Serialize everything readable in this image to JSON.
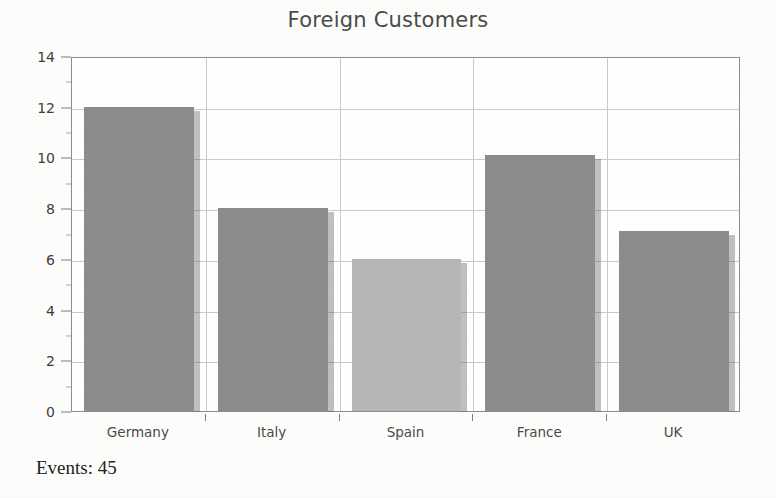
{
  "chart_data": {
    "type": "bar",
    "title": "Foreign Customers",
    "xlabel": "",
    "ylabel": "",
    "categories": [
      "Germany",
      "Italy",
      "Spain",
      "France",
      "UK"
    ],
    "values": [
      12.0,
      8.0,
      6.0,
      10.1,
      7.1
    ],
    "series": [
      {
        "name": "Foreign Customers",
        "values": [
          12.0,
          8.0,
          6.0,
          10.1,
          7.1
        ]
      }
    ],
    "ylim": [
      0,
      14
    ],
    "y_ticks": [
      0,
      2,
      4,
      6,
      8,
      10,
      12,
      14
    ],
    "y_tick_labels": [
      "0",
      "2",
      "4",
      "6",
      "8",
      "10",
      "12",
      "14"
    ],
    "grid": "both",
    "legend": "none",
    "bar_colors": [
      "#8c8c8c",
      "#8c8c8c",
      "#b6b6b6",
      "#8c8c8c",
      "#8c8c8c"
    ],
    "highlighted_category": "Spain",
    "annotations": [
      {
        "name": "events-count",
        "text": "Events: 45"
      }
    ]
  },
  "footer": {
    "events_label": "Events: 45"
  },
  "colors": {
    "bar_default": "#8c8c8c",
    "bar_highlight": "#b6b6b6",
    "grid": "#c9c9c9",
    "frame": "#8d8d8d",
    "title_text": "#4b4b4b",
    "axis_text": "#3d3d3d",
    "footer_text": "#1f1f1f",
    "background": "#fdfdfc"
  }
}
